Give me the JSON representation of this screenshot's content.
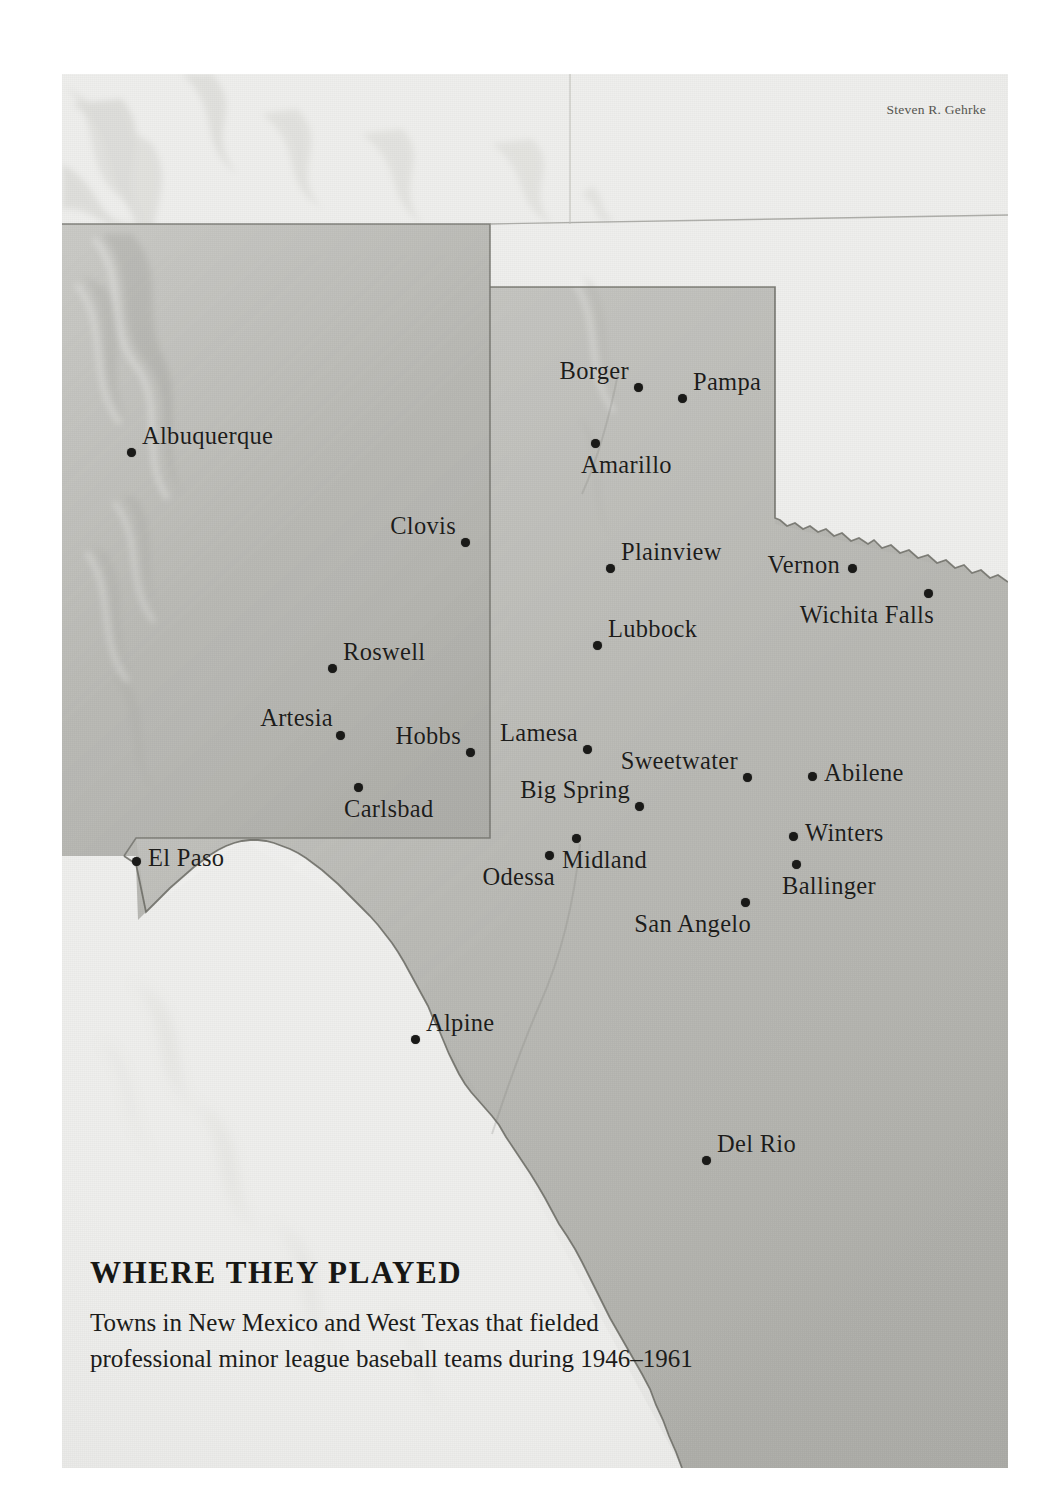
{
  "credit": "Steven R. Gehrke",
  "caption": {
    "title": "WHERE THEY PLAYED",
    "line1": "Towns in New Mexico and West Texas that fielded",
    "line2": "professional minor league baseball teams during 1946–1961"
  },
  "map": {
    "type": "reference-map",
    "region": "New Mexico and West Texas",
    "land_fill": "#b9b9b4",
    "outside_fill": "#eeeeec",
    "border_stroke": "#6f6f69",
    "marker_color": "#1a1a18",
    "states_shaded": [
      "New Mexico",
      "Texas"
    ],
    "cities": [
      {
        "name": "Albuquerque",
        "x": 131,
        "y": 452,
        "label_pos": "right"
      },
      {
        "name": "Borger",
        "x": 638,
        "y": 387,
        "label_pos": "left"
      },
      {
        "name": "Pampa",
        "x": 682,
        "y": 398,
        "label_pos": "right"
      },
      {
        "name": "Amarillo",
        "x": 595,
        "y": 443,
        "label_pos": "below"
      },
      {
        "name": "Clovis",
        "x": 465,
        "y": 542,
        "label_pos": "left"
      },
      {
        "name": "Plainview",
        "x": 610,
        "y": 568,
        "label_pos": "right"
      },
      {
        "name": "Vernon",
        "x": 852,
        "y": 568,
        "label_pos": "left-mid"
      },
      {
        "name": "Wichita Falls",
        "x": 928,
        "y": 593,
        "label_pos": "below-left"
      },
      {
        "name": "Lubbock",
        "x": 597,
        "y": 645,
        "label_pos": "right"
      },
      {
        "name": "Roswell",
        "x": 332,
        "y": 668,
        "label_pos": "right"
      },
      {
        "name": "Artesia",
        "x": 340,
        "y": 735,
        "label_pos": "above-left"
      },
      {
        "name": "Hobbs",
        "x": 470,
        "y": 752,
        "label_pos": "left"
      },
      {
        "name": "Lamesa",
        "x": 587,
        "y": 749,
        "label_pos": "left"
      },
      {
        "name": "Sweetwater",
        "x": 747,
        "y": 777,
        "label_pos": "left"
      },
      {
        "name": "Abilene",
        "x": 812,
        "y": 776,
        "label_pos": "right-mid"
      },
      {
        "name": "Big Spring",
        "x": 639,
        "y": 806,
        "label_pos": "left"
      },
      {
        "name": "Carlsbad",
        "x": 358,
        "y": 787,
        "label_pos": "below"
      },
      {
        "name": "Winters",
        "x": 793,
        "y": 836,
        "label_pos": "right-mid"
      },
      {
        "name": "Midland",
        "x": 576,
        "y": 838,
        "label_pos": "below"
      },
      {
        "name": "Odessa",
        "x": 549,
        "y": 855,
        "label_pos": "below-left"
      },
      {
        "name": "El Paso",
        "x": 136,
        "y": 861,
        "label_pos": "right-mid"
      },
      {
        "name": "Ballinger",
        "x": 796,
        "y": 864,
        "label_pos": "below"
      },
      {
        "name": "San Angelo",
        "x": 745,
        "y": 902,
        "label_pos": "below-left"
      },
      {
        "name": "Alpine",
        "x": 415,
        "y": 1039,
        "label_pos": "right"
      },
      {
        "name": "Del Rio",
        "x": 706,
        "y": 1160,
        "label_pos": "right"
      }
    ]
  }
}
